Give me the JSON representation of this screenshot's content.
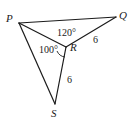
{
  "figure": {
    "type": "geometry-diagram",
    "background_color": "#ffffff",
    "stroke_color": "#1b1b1b",
    "vertices": [
      {
        "id": "P",
        "label": "P",
        "x": 19,
        "y": 23
      },
      {
        "id": "Q",
        "label": "Q",
        "x": 116,
        "y": 17
      },
      {
        "id": "R",
        "label": "R",
        "x": 66,
        "y": 47
      },
      {
        "id": "S",
        "label": "S",
        "x": 55,
        "y": 104
      }
    ],
    "segments": [
      {
        "from": "P",
        "to": "Q"
      },
      {
        "from": "Q",
        "to": "R"
      },
      {
        "from": "R",
        "to": "P"
      },
      {
        "from": "P",
        "to": "S"
      },
      {
        "from": "S",
        "to": "R"
      }
    ],
    "angles": [
      {
        "at": "R",
        "between": "Q-R-P",
        "value": "120°"
      },
      {
        "at": "R",
        "between": "P-R-S",
        "value": "100°"
      }
    ],
    "side_lengths": [
      {
        "segment": "R-Q",
        "value": "6"
      },
      {
        "segment": "R-S",
        "value": "6"
      }
    ]
  }
}
